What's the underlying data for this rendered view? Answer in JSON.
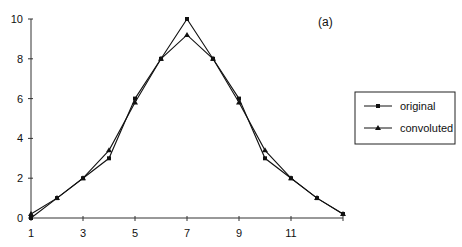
{
  "chart_data": {
    "type": "line",
    "title": "",
    "panel_label": "(a)",
    "xlabel": "",
    "ylabel": "",
    "x": [
      1,
      2,
      3,
      4,
      5,
      6,
      7,
      8,
      9,
      10,
      11,
      12,
      13
    ],
    "xticks": [
      1,
      3,
      5,
      7,
      9,
      11
    ],
    "yticks": [
      0,
      2,
      4,
      6,
      8,
      10
    ],
    "xlim": [
      1,
      13
    ],
    "ylim": [
      0,
      10
    ],
    "grid": false,
    "legend_position": "right",
    "series": [
      {
        "name": "original",
        "marker": "square",
        "values": [
          0,
          1,
          2,
          3,
          6,
          8,
          10,
          8,
          6,
          3,
          2,
          1,
          0.2
        ]
      },
      {
        "name": "convoluted",
        "marker": "triangle",
        "values": [
          0.2,
          1,
          2,
          3.4,
          5.8,
          8,
          9.2,
          8,
          5.8,
          3.4,
          2,
          1,
          0.2
        ]
      }
    ]
  },
  "colors": {
    "line": "#111111",
    "background": "#ffffff"
  }
}
